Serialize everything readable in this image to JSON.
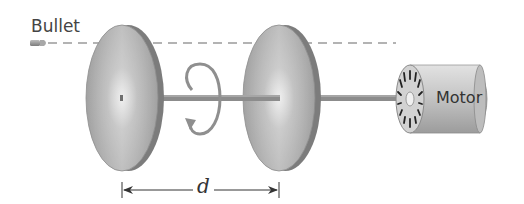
{
  "diagram": {
    "labels": {
      "bullet": "Bullet",
      "motor": "Motor",
      "distance": "d"
    },
    "elements": [
      {
        "id": "bullet",
        "type": "projectile"
      },
      {
        "id": "bullet-path",
        "type": "dashed-line"
      },
      {
        "id": "disk-1",
        "type": "disk"
      },
      {
        "id": "disk-2",
        "type": "disk"
      },
      {
        "id": "axle",
        "type": "shaft"
      },
      {
        "id": "rotation-arrow",
        "type": "curved-arrow"
      },
      {
        "id": "motor",
        "type": "motor"
      },
      {
        "id": "distance-marker",
        "type": "dimension-line",
        "label": "d"
      }
    ],
    "colors": {
      "disk_face": "#a8a8a8",
      "disk_edge": "#7a7a7a",
      "axle": "#8a8a8a",
      "dashed_line": "#9a9a9a",
      "arrow": "#909090",
      "motor_body": "#c8c8c8"
    }
  }
}
